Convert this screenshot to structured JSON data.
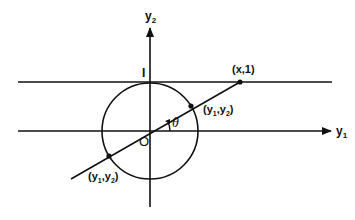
{
  "diagram": {
    "type": "geometry",
    "colors": {
      "stroke": "#111111",
      "background": "#ffffff"
    },
    "axes": {
      "horizontal": {
        "label_main": "y",
        "label_sub": "1"
      },
      "vertical": {
        "label_main": "y",
        "label_sub": "2"
      }
    },
    "labels": {
      "tick_one": "I",
      "origin": "O",
      "angle": "θ",
      "point_upper": "(x,1)",
      "point_circle_upper_open": "(y",
      "point_circle_upper_sub1": "1",
      "point_circle_upper_comma": ",y",
      "point_circle_upper_sub2": "2",
      "point_circle_upper_close": ")",
      "point_circle_lower_open": "(y",
      "point_circle_lower_sub1": "1",
      "point_circle_lower_comma": ",y",
      "point_circle_lower_sub2": "2",
      "point_circle_lower_close": ")"
    },
    "geometry": {
      "circle": {
        "cx": 150,
        "cy": 131,
        "r": 48
      },
      "line_y_equals_1": {
        "y": 82
      },
      "ray_points": [
        {
          "name": "(x,1)",
          "x": 240,
          "y": 82
        },
        {
          "name": "(y1,y2) upper",
          "x": 191,
          "y": 106
        },
        {
          "name": "(y1,y2) lower",
          "x": 109,
          "y": 156
        }
      ]
    }
  }
}
